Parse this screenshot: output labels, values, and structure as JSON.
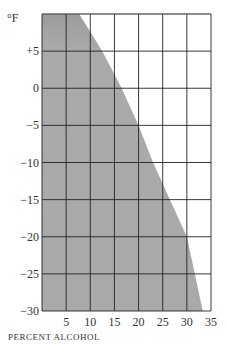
{
  "chart_data": {
    "type": "area",
    "title": "",
    "xlabel": "PERCENT ALCOHOL",
    "ylabel": "°F",
    "xlim": [
      0,
      35
    ],
    "ylim": [
      -30,
      10
    ],
    "x_ticks": [
      "5",
      "10",
      "15",
      "20",
      "25",
      "30",
      "35"
    ],
    "y_ticks": [
      "+5",
      "0",
      "−5",
      "−10",
      "−15",
      "−20",
      "−25",
      "−30"
    ],
    "grid": true,
    "legend": null,
    "series": [
      {
        "name": "Freezing boundary (shaded = frozen region)",
        "x": [
          7.7,
          12.5,
          16.5,
          20.0,
          23.0,
          26.5,
          30.0,
          33.3
        ],
        "y": [
          10,
          5,
          0,
          -5,
          -10,
          -15,
          -20,
          -30
        ]
      }
    ],
    "shade_color": "#a9a9a9",
    "grid_color": "#222222"
  },
  "labels": {
    "unit": "°F",
    "xtitle": "PERCENT ALCOHOL"
  }
}
